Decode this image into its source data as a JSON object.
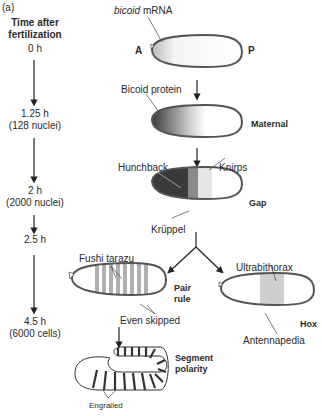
{
  "panel_label": "(a)",
  "timeline": {
    "title_line1": "Time after",
    "title_line2": "fertilization",
    "stages": [
      {
        "time": "0 h",
        "detail": ""
      },
      {
        "time": "1.25 h",
        "detail": "(128 nuclei)"
      },
      {
        "time": "2 h",
        "detail": "(2000 nuclei)"
      },
      {
        "time": "2.5 h",
        "detail": ""
      },
      {
        "time": "4.5 h",
        "detail": "(6000 cells)"
      }
    ]
  },
  "embryos": {
    "mrna": {
      "label_italic": "bicoid",
      "label_rest": " mRNA",
      "anterior": "A",
      "posterior": "P"
    },
    "maternal": {
      "protein_label": "Bicoid protein",
      "class_label": "Maternal"
    },
    "gap": {
      "genes": [
        "Hunchback",
        "Knirps",
        "Krüppel"
      ],
      "class_label": "Gap"
    },
    "pair_rule": {
      "genes": [
        "Fushi tarazu",
        "Even skipped"
      ],
      "class_label_line1": "Pair",
      "class_label_line2": "rule"
    },
    "hox": {
      "genes": [
        "Ultrabithorax",
        "Antennapedia"
      ],
      "class_label": "Hox"
    },
    "segment_polarity": {
      "genes": [
        "Engrailed"
      ],
      "class_label_line1": "Segment",
      "class_label_line2": "polarity"
    }
  },
  "colors": {
    "outline": "#555555",
    "hunchback": "#3a3a3a",
    "kruppel": "#8a8a8a",
    "knirps": "#e6e6e6",
    "stripe": "#b0b0b0",
    "hox_band": "#cfcfcf"
  }
}
